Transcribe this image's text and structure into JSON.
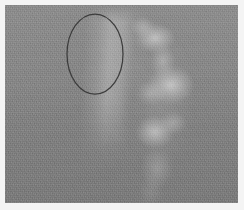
{
  "image": {
    "kind": "grayscale-medical-scan",
    "modality_appearance": "ultrasound-like grainy grayscale",
    "width_px": 244,
    "height_px": 210,
    "border": {
      "style": "light margin frame",
      "color": "#f4f4f4",
      "thickness_px": 5
    },
    "canvas": {
      "background_color": "#828282",
      "x_px": 5,
      "y_px": 5,
      "width_px": 233,
      "height_px": 198,
      "texture": "film-grain speckle with faint horizontal banding"
    }
  },
  "annotations": [
    {
      "type": "ellipse",
      "name": "region-of-interest-ellipse",
      "stroke_color": "#3c3c3c",
      "stroke_width_px": 1.25,
      "fill": "none",
      "center_x_px": 90,
      "center_y_px": 49,
      "radius_x_px": 28,
      "radius_y_px": 40
    }
  ],
  "features": [
    {
      "name": "bright-vertical-streak",
      "description": "soft bright vertical band inside the marked ellipse",
      "approx_x_px": 100,
      "approx_y_px": 48,
      "brightness": "light gray"
    },
    {
      "name": "bright-structure-upper-lobe",
      "description": "bright irregular lobe at upper right",
      "approx_x_px": 155,
      "approx_y_px": 38,
      "brightness": "bright"
    },
    {
      "name": "bright-structure-mid-lobe",
      "description": "widest and brightest lobe of the vertical chain",
      "approx_x_px": 171,
      "approx_y_px": 85,
      "brightness": "brightest"
    },
    {
      "name": "bright-structure-lower-lobe",
      "description": "bright blob below the mid lobe",
      "approx_x_px": 155,
      "approx_y_px": 132,
      "brightness": "bright"
    },
    {
      "name": "bright-structure-tail",
      "description": "dimming tail of the structure descending toward the bottom",
      "approx_x_px": 152,
      "approx_y_px": 180,
      "brightness": "dim"
    },
    {
      "name": "shadow-pocket",
      "description": "darker region left of the bright chain",
      "approx_x_px": 122,
      "approx_y_px": 107,
      "brightness": "dark"
    }
  ],
  "colors": {
    "frame": "#f4f4f4",
    "background_gray": "#828282",
    "highlight_gray": "#cdcdcd",
    "shadow_gray": "#6b6b6b",
    "annotation_stroke": "#3c3c3c"
  }
}
